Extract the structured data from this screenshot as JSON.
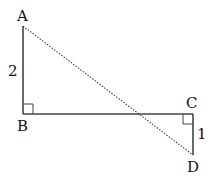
{
  "diagram": {
    "points": {
      "A": {
        "label": "A",
        "x": 23,
        "y": 26
      },
      "B": {
        "label": "B",
        "x": 23,
        "y": 114
      },
      "C": {
        "label": "C",
        "x": 193,
        "y": 114
      },
      "D": {
        "label": "D",
        "x": 193,
        "y": 155
      }
    },
    "lengths": {
      "AB": "2",
      "CD": "1"
    },
    "segments": [
      {
        "from": "A",
        "to": "B",
        "style": "solid"
      },
      {
        "from": "B",
        "to": "C",
        "style": "solid"
      },
      {
        "from": "C",
        "to": "D",
        "style": "solid"
      },
      {
        "from": "A",
        "to": "D",
        "style": "dotted"
      }
    ],
    "right_angles": [
      "B",
      "C"
    ],
    "colors": {
      "line": "#333333",
      "text": "#111111"
    }
  }
}
